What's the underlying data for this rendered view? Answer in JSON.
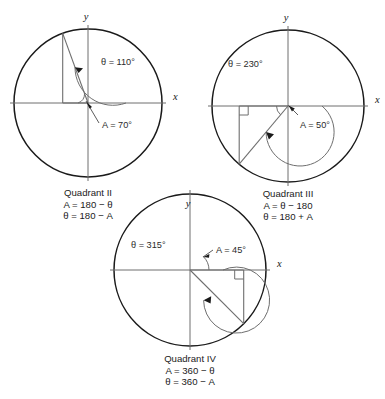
{
  "figure": {
    "background": "#ffffff",
    "ink": "#1a1a1a",
    "axis_color": "#6e6e6e"
  },
  "panels": [
    {
      "id": "quadrant-2",
      "caption": "Quadrant II",
      "formula_1": "A = 180 − θ",
      "formula_2": "θ = 180 − A",
      "theta_label": "θ = 110°",
      "ref_label": "A = 70°",
      "theta_value": 110,
      "ref_value": 70,
      "axis_x_label": "x",
      "axis_y_label": "y"
    },
    {
      "id": "quadrant-3",
      "caption": "Quadrant III",
      "formula_1": "A = θ − 180",
      "formula_2": "θ = 180 + A",
      "theta_label": "θ = 230°",
      "ref_label": "A = 50°",
      "theta_value": 230,
      "ref_value": 50,
      "axis_x_label": "x",
      "axis_y_label": "y"
    },
    {
      "id": "quadrant-4",
      "caption": "Quadrant IV",
      "formula_1": "A = 360 − θ",
      "formula_2": "θ = 360 − A",
      "theta_label": "θ = 315°",
      "ref_label": "A = 45°",
      "theta_value": 315,
      "ref_value": 45,
      "axis_x_label": "x",
      "axis_y_label": "y"
    }
  ]
}
